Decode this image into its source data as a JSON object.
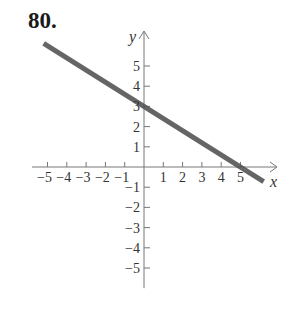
{
  "problem": {
    "number": "80."
  },
  "chart_data": {
    "type": "line",
    "title": "",
    "xlabel": "x",
    "ylabel": "y",
    "xlim": [
      -5.8,
      6.8
    ],
    "ylim": [
      -6,
      6.7
    ],
    "x_ticks": [
      -5,
      -4,
      -3,
      -2,
      -1,
      1,
      2,
      3,
      4,
      5
    ],
    "y_ticks": [
      -5,
      -4,
      -3,
      -2,
      -1,
      1,
      2,
      3,
      4,
      5
    ],
    "x_tick_labels": [
      "−5",
      "−4",
      "−3",
      "−2",
      "−1",
      "1",
      "2",
      "3",
      "4",
      "5"
    ],
    "y_tick_labels": [
      "−5",
      "−4",
      "−3",
      "−2",
      "−1",
      "1",
      "2",
      "3",
      "4",
      "5"
    ],
    "grid": false,
    "series": [
      {
        "name": "line",
        "equation": "y = -3/5 x + 3",
        "slope": -0.6,
        "y_intercept": 3,
        "x_intercept": 5,
        "x": [
          -5.2,
          0,
          5,
          6.2
        ],
        "y": [
          6.12,
          3,
          0,
          -0.72
        ],
        "color": "#555555"
      }
    ]
  }
}
